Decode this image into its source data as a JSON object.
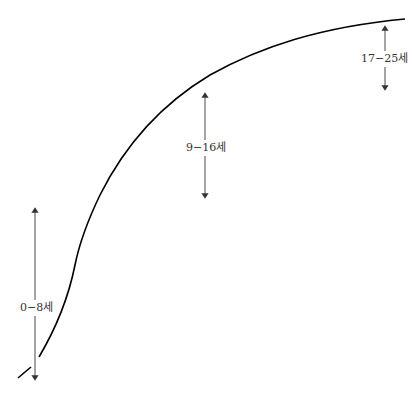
{
  "diagram": {
    "type": "growth-curve",
    "curve_color": "#000000",
    "arrow_color": "#333333",
    "stages": [
      {
        "label": "0−8세"
      },
      {
        "label": "9−16세"
      },
      {
        "label": "17−25세"
      }
    ]
  }
}
